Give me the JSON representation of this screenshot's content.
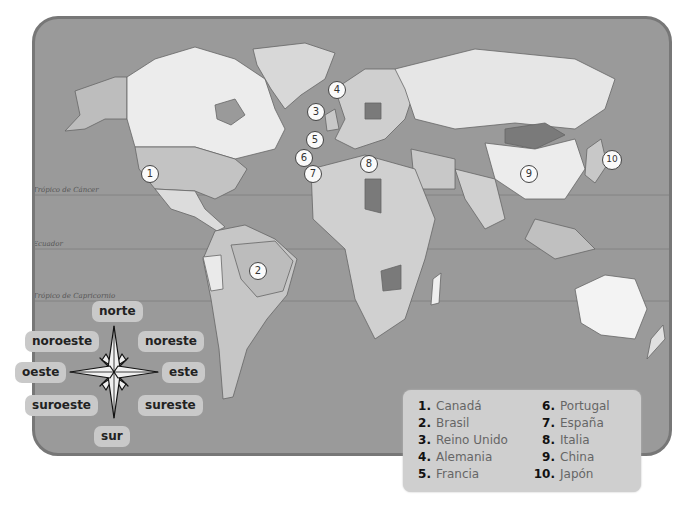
{
  "map": {
    "lines": {
      "tropic_cancer": "Trópico de Cáncer",
      "equator": "Ecuador",
      "tropic_capricorn": "Trópico de Capricornio"
    },
    "markers": [
      {
        "n": "1",
        "country": "Canadá"
      },
      {
        "n": "2",
        "country": "Brasil"
      },
      {
        "n": "3",
        "country": "Reino Unido"
      },
      {
        "n": "4",
        "country": "Alemania"
      },
      {
        "n": "5",
        "country": "Francia"
      },
      {
        "n": "6",
        "country": "Portugal"
      },
      {
        "n": "7",
        "country": "España"
      },
      {
        "n": "8",
        "country": "Italia"
      },
      {
        "n": "9",
        "country": "China"
      },
      {
        "n": "10",
        "country": "Japón"
      }
    ],
    "colors": {
      "ocean": "#9a9a9a",
      "land_light": "#e8e8e8",
      "land_mid": "#bdbdbd",
      "land_dark": "#7a7a7a",
      "frame": "#777777"
    }
  },
  "compass": {
    "north": "norte",
    "northwest": "noroeste",
    "northeast": "noreste",
    "west": "oeste",
    "east": "este",
    "southwest": "suroeste",
    "southeast": "sureste",
    "south": "sur"
  },
  "legend": {
    "items": [
      {
        "num": "1.",
        "name": "Canadá"
      },
      {
        "num": "2.",
        "name": "Brasil"
      },
      {
        "num": "3.",
        "name": "Reino Unido"
      },
      {
        "num": "4.",
        "name": "Alemania"
      },
      {
        "num": "5.",
        "name": "Francia"
      },
      {
        "num": "6.",
        "name": "Portugal"
      },
      {
        "num": "7.",
        "name": "España"
      },
      {
        "num": "8.",
        "name": "Italia"
      },
      {
        "num": "9.",
        "name": "China"
      },
      {
        "num": "10.",
        "name": "Japón"
      }
    ]
  }
}
